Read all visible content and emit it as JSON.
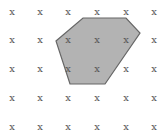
{
  "diagram": {
    "grid": {
      "columns_x": [
        12,
        40,
        68,
        97,
        126,
        154
      ],
      "rows_y": [
        12,
        40,
        69,
        98,
        127
      ],
      "marker": "x"
    },
    "polygon": {
      "points": "83,18 126,18 140,33 105,84 70,84 56,41",
      "fill": "#b3b3b3",
      "stroke": "#666666"
    }
  }
}
